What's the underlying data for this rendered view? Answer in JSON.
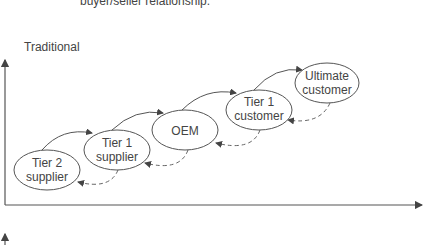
{
  "caption": "buyer/seller relationship.",
  "section_label": "Traditional",
  "nodes": [
    {
      "line1": "Tier 2",
      "line2": "supplier"
    },
    {
      "line1": "Tier 1",
      "line2": "supplier"
    },
    {
      "line1": "OEM",
      "line2": ""
    },
    {
      "line1": "Tier 1",
      "line2": "customer"
    },
    {
      "line1": "Ultimate",
      "line2": "customer"
    }
  ],
  "colors": {
    "stroke": "#555555",
    "text": "#444444"
  }
}
